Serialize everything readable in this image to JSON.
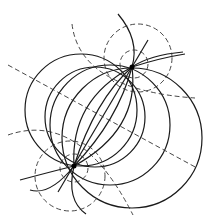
{
  "diagram": {
    "title": "",
    "colors": {
      "background": "#ffffff",
      "stroke": "#1a1a1a",
      "dashed": "#333333"
    },
    "foci": [
      {
        "name": "upper-focus",
        "x": 132,
        "y": 67
      },
      {
        "name": "lower-focus",
        "x": 74,
        "y": 166
      }
    ]
  }
}
